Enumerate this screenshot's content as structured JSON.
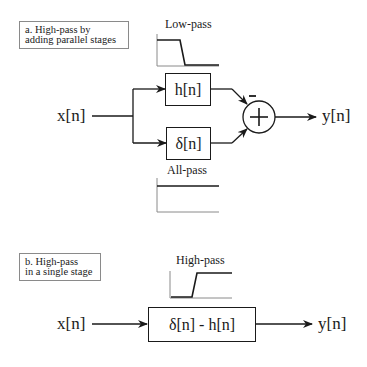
{
  "section_a": {
    "caption_line1": "a.  High-pass by",
    "caption_line2": "adding parallel stages",
    "input_label": "x[n]",
    "output_label": "y[n]",
    "top_block": "h[n]",
    "bottom_block": "δ[n]",
    "top_response_label": "Low-pass",
    "bottom_response_label": "All-pass",
    "summer_symbol": "+",
    "minus_sign": "–",
    "top_response_type": "low-pass",
    "bottom_response_type": "all-pass"
  },
  "section_b": {
    "caption_line1": "b.  High-pass",
    "caption_line2": "in a single stage",
    "input_label": "x[n]",
    "output_label": "y[n]",
    "block": "δ[n] - h[n]",
    "response_label": "High-pass",
    "response_type": "high-pass"
  }
}
